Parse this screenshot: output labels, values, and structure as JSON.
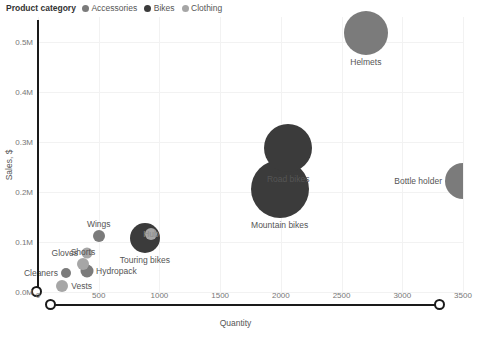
{
  "legend": {
    "title": "Product category",
    "items": [
      {
        "label": "Accessories",
        "color": "#7b7b7b"
      },
      {
        "label": "Bikes",
        "color": "#3b3b3b"
      },
      {
        "label": "Clothing",
        "color": "#a6a6a6"
      }
    ]
  },
  "chart_data": {
    "type": "scatter",
    "title": "",
    "xlabel": "Quantity",
    "ylabel": "Sales, $",
    "xlim": [
      0,
      3500
    ],
    "ylim": [
      0,
      550000
    ],
    "xticks": [
      "0",
      "500",
      "1000",
      "1500",
      "2000",
      "2500",
      "3000",
      "3500"
    ],
    "xtick_values": [
      0,
      500,
      1000,
      1500,
      2000,
      2500,
      3000,
      3500
    ],
    "yticks": [
      "0.0M",
      "0.1M",
      "0.2M",
      "0.3M",
      "0.4M",
      "0.5M"
    ],
    "ytick_values": [
      0,
      100000,
      200000,
      300000,
      400000,
      500000
    ],
    "grid": true,
    "legend_position": "top-left",
    "series": [
      {
        "name": "Accessories",
        "color": "#7b7b7b",
        "points": [
          {
            "label": "Helmets",
            "x": 2700,
            "y": 518000,
            "size": 44,
            "label_pos": "below"
          },
          {
            "label": "Bottle holder",
            "x": 3500,
            "y": 222000,
            "size": 36,
            "label_pos": "left",
            "clipped": true
          },
          {
            "label": "Wings",
            "x": 500,
            "y": 112000,
            "size": 12,
            "label_pos": "above"
          },
          {
            "label": "Hydropack",
            "x": 400,
            "y": 42000,
            "size": 13,
            "label_pos": "right"
          },
          {
            "label": "Cleaners",
            "x": 230,
            "y": 38000,
            "size": 10,
            "label_pos": "left"
          }
        ]
      },
      {
        "name": "Bikes",
        "color": "#3b3b3b",
        "points": [
          {
            "label": "Road bikes",
            "x": 2060,
            "y": 288000,
            "size": 48,
            "label_pos": "below"
          },
          {
            "label": "Mountain bikes",
            "x": 1990,
            "y": 207000,
            "size": 58,
            "label_pos": "below"
          },
          {
            "label": "Touring bikes",
            "x": 880,
            "y": 108000,
            "size": 30,
            "label_pos": "below"
          }
        ]
      },
      {
        "name": "Clothing",
        "color": "#a6a6a6",
        "points": [
          {
            "label": "Hub",
            "x": 930,
            "y": 116000,
            "size": 12,
            "label_pos": "inner"
          },
          {
            "label": "Gloves",
            "x": 400,
            "y": 78000,
            "size": 11,
            "label_pos": "left"
          },
          {
            "label": "Shorts",
            "x": 370,
            "y": 56000,
            "size": 12,
            "label_pos": "above"
          },
          {
            "label": "Vests",
            "x": 200,
            "y": 12000,
            "size": 12,
            "label_pos": "right"
          }
        ]
      }
    ]
  }
}
